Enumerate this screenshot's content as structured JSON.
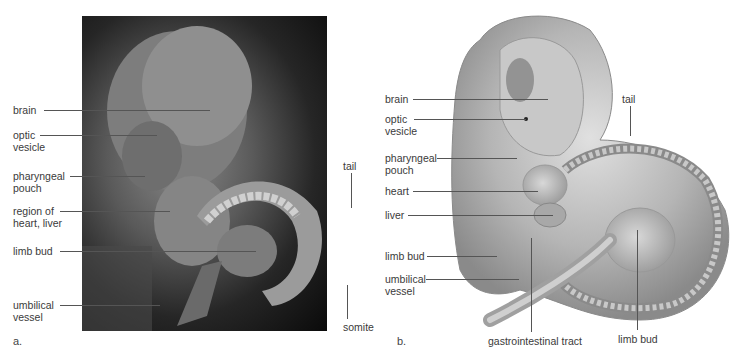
{
  "figure": {
    "panel_a": {
      "letter": "a.",
      "type": "scanning electron micrograph",
      "labels": [
        {
          "id": "brain",
          "lines": [
            "brain"
          ]
        },
        {
          "id": "optic-vesicle",
          "lines": [
            "optic",
            "vesicle"
          ]
        },
        {
          "id": "pharyngeal-pouch",
          "lines": [
            "pharyngeal",
            "pouch"
          ]
        },
        {
          "id": "region-heart-liver",
          "lines": [
            "region of",
            "heart, liver"
          ]
        },
        {
          "id": "limb-bud",
          "lines": [
            "limb bud"
          ]
        },
        {
          "id": "umbilical-vessel",
          "lines": [
            "umbilical",
            "vessel"
          ]
        },
        {
          "id": "tail",
          "lines": [
            "tail"
          ]
        },
        {
          "id": "somite",
          "lines": [
            "somite"
          ]
        }
      ]
    },
    "panel_b": {
      "letter": "b.",
      "type": "illustration",
      "labels": [
        {
          "id": "brain",
          "lines": [
            "brain"
          ]
        },
        {
          "id": "optic-vesicle",
          "lines": [
            "optic",
            "vesicle"
          ]
        },
        {
          "id": "pharyngeal-pouch",
          "lines": [
            "pharyngeal",
            "pouch"
          ]
        },
        {
          "id": "heart",
          "lines": [
            "heart"
          ]
        },
        {
          "id": "liver",
          "lines": [
            "liver"
          ]
        },
        {
          "id": "limb-bud-left",
          "lines": [
            "limb bud"
          ]
        },
        {
          "id": "umbilical-vessel",
          "lines": [
            "umbilical",
            "vessel"
          ]
        },
        {
          "id": "tail",
          "lines": [
            "tail"
          ]
        },
        {
          "id": "gastrointestinal-tract",
          "lines": [
            "gastrointestinal tract"
          ]
        },
        {
          "id": "limb-bud-bottom",
          "lines": [
            "limb bud"
          ]
        }
      ]
    }
  }
}
